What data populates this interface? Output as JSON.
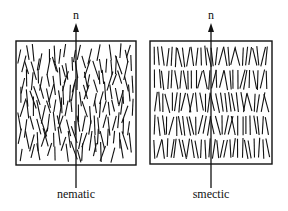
{
  "figure": {
    "panels": [
      {
        "id": "nematic",
        "label": "nematic",
        "director_label": "n",
        "box": {
          "x": 16,
          "y": 41,
          "w": 120,
          "h": 124
        },
        "arrow_x": 76,
        "arrangement": "orientational order only, random positions"
      },
      {
        "id": "smectic",
        "label": "smectic",
        "director_label": "n",
        "box": {
          "x": 150,
          "y": 41,
          "w": 122,
          "h": 123
        },
        "arrow_x": 211,
        "layers": 5,
        "arrangement": "orientational order plus layered positional order"
      }
    ],
    "colors": {
      "stroke": "#111111",
      "background": "#ffffff"
    }
  }
}
